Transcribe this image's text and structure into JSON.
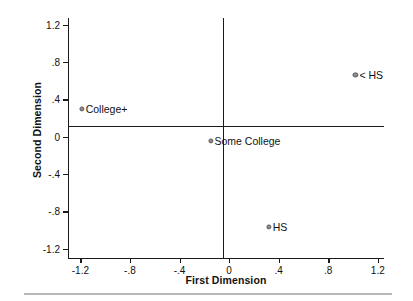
{
  "chart_data": {
    "type": "scatter",
    "title": "",
    "xlabel": "First Dimension",
    "ylabel": "Second Dimension",
    "xlim": [
      -1.3,
      1.25
    ],
    "ylim": [
      -1.3,
      1.27
    ],
    "xticks": [
      -1.2,
      -0.8,
      -0.4,
      0,
      0.4,
      0.8,
      1.2
    ],
    "xticklabels": [
      "-1.2",
      "-.8",
      "-.4",
      "0",
      ".4",
      ".8",
      "1.2"
    ],
    "yticks": [
      1.2,
      0.8,
      0.4,
      0,
      -0.4,
      -0.8,
      -1.2
    ],
    "yticklabels": [
      "1.2",
      ".8",
      ".4",
      "0",
      "-.4",
      "-.8",
      "-1.2"
    ],
    "grid": false,
    "legend": "none",
    "reference_lines": {
      "horizontal": 0,
      "vertical": 0
    },
    "marker_color": "#8c8c8c",
    "marker_edge_color": "#5d5d5d",
    "axis_color": "#1a1a1a",
    "points": [
      {
        "label": "< HS",
        "x": 1.02,
        "y": 0.66
      },
      {
        "label": "College+",
        "x": -1.19,
        "y": 0.3
      },
      {
        "label": "Some College",
        "x": -0.15,
        "y": -0.05
      },
      {
        "label": "HS",
        "x": 0.32,
        "y": -0.97
      }
    ]
  }
}
